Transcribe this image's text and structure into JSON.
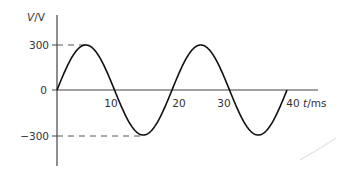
{
  "chart_data": {
    "type": "line",
    "title": "",
    "xlabel": "t/ms",
    "ylabel": "V/V",
    "xlabel_var": "t",
    "xlabel_unit": "/ms",
    "ylabel_var": "V",
    "ylabel_unit": "/V",
    "x_ticks": [
      10,
      20,
      30,
      40
    ],
    "x_tick_labels": [
      "10",
      "20",
      "30",
      "40"
    ],
    "y_ticks": [
      300,
      0,
      -300
    ],
    "y_tick_labels": [
      "300",
      "0",
      "-300"
    ],
    "xlim": [
      0,
      45
    ],
    "ylim": [
      -450,
      450
    ],
    "grid": false,
    "legend": null,
    "series": [
      {
        "name": "V(t) = 300 sin(2π t / 20)",
        "amplitude": 300,
        "period_ms": 20,
        "x": [
          0,
          5,
          10,
          15,
          20,
          25,
          30,
          35,
          40
        ],
        "values": [
          0,
          300,
          0,
          -300,
          0,
          300,
          0,
          -300,
          0
        ]
      }
    ],
    "annotations": [
      {
        "type": "dashed-guide",
        "y": 300,
        "from_x": 0,
        "to_x": 5
      },
      {
        "type": "dashed-guide",
        "y": -300,
        "from_x": 0,
        "to_x": 15
      }
    ]
  }
}
